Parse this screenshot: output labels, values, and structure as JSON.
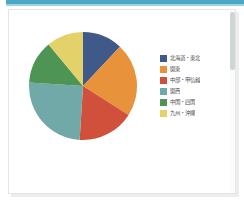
{
  "window": {
    "accent_color": "#4aa8c4",
    "background": "#ffffff"
  },
  "scrollbar": {
    "name": "vertical-scrollbar",
    "thumb_color": "#cfd4d4"
  },
  "chart_data": {
    "type": "pie",
    "title": "",
    "subtitle": "",
    "xlabel": "",
    "ylabel": "",
    "legend_position": "right",
    "grid": false,
    "start_angle_deg": 0,
    "direction": "clockwise",
    "categories": [
      "北海道・東北",
      "関東",
      "中部・甲信越",
      "関西",
      "中国・四国",
      "九州・沖縄"
    ],
    "values": [
      12,
      22,
      17,
      25,
      13,
      11
    ],
    "unit": "%",
    "colors": [
      "#3f5a89",
      "#e8923c",
      "#d1503c",
      "#71a8a8",
      "#4e9455",
      "#e3d26a"
    ],
    "slices": [
      {
        "label": "北海道・東北",
        "value": 12,
        "color": "#3f5a89"
      },
      {
        "label": "関東",
        "value": 22,
        "color": "#e8923c"
      },
      {
        "label": "中部・甲信越",
        "value": 17,
        "color": "#d1503c"
      },
      {
        "label": "関西",
        "value": 25,
        "color": "#71a8a8"
      },
      {
        "label": "中国・四国",
        "value": 13,
        "color": "#4e9455"
      },
      {
        "label": "九州・沖縄",
        "value": 11,
        "color": "#e3d26a"
      }
    ]
  }
}
